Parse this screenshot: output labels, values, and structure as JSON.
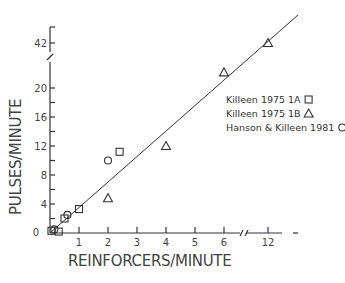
{
  "chart_data": {
    "type": "scatter",
    "title": "",
    "xlabel": "REINFORCERS/MINUTE",
    "ylabel": "PULSES/MINUTE",
    "x_ticks": [
      "0",
      "1",
      "2",
      "3",
      "4",
      "5",
      "6",
      "12"
    ],
    "y_ticks": [
      "0",
      "4",
      "8",
      "12",
      "16",
      "20",
      "42"
    ],
    "x_axis_break": "between 6 and 12",
    "y_axis_break": "between 20 and 42",
    "xlim": [
      0,
      12
    ],
    "ylim": [
      0,
      42
    ],
    "legend_position": "right",
    "series": [
      {
        "name": "Killeen 1975 1A",
        "marker": "square",
        "points": [
          [
            0.05,
            0.3
          ],
          [
            0.3,
            0.2
          ],
          [
            0.5,
            2.0
          ],
          [
            1.0,
            3.3
          ],
          [
            2.4,
            11.2
          ]
        ]
      },
      {
        "name": "Killeen 1975 1B",
        "marker": "triangle",
        "points": [
          [
            2.0,
            4.8
          ],
          [
            4.0,
            12.0
          ],
          [
            6.0,
            21.0
          ],
          [
            12.0,
            42.0
          ]
        ]
      },
      {
        "name": "Hanson & Killeen 1981",
        "marker": "circle",
        "points": [
          [
            0.15,
            0.5
          ],
          [
            0.6,
            2.5
          ],
          [
            2.0,
            10.0
          ]
        ]
      }
    ],
    "fit_line": {
      "from": [
        0,
        0
      ],
      "to": [
        12.5,
        44
      ]
    }
  }
}
